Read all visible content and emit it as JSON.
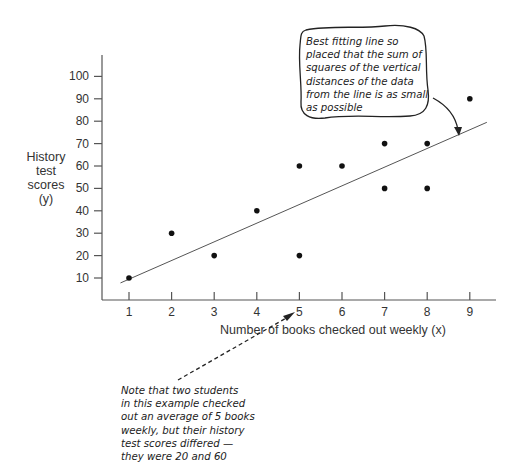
{
  "chart_data": {
    "type": "scatter",
    "title": "",
    "xlabel": "Number of books checked out weekly (x)",
    "ylabel": [
      "History",
      "test",
      "scores",
      "(y)"
    ],
    "x_ticks": [
      1,
      2,
      3,
      4,
      5,
      6,
      7,
      8,
      9
    ],
    "y_ticks": [
      10,
      20,
      30,
      40,
      50,
      60,
      70,
      80,
      90,
      100
    ],
    "xlim": [
      0.4,
      9.6
    ],
    "ylim": [
      0,
      105
    ],
    "grid": false,
    "points": [
      {
        "x": 1,
        "y": 10
      },
      {
        "x": 2,
        "y": 30
      },
      {
        "x": 3,
        "y": 20
      },
      {
        "x": 4,
        "y": 40
      },
      {
        "x": 5,
        "y": 20
      },
      {
        "x": 5,
        "y": 60
      },
      {
        "x": 6,
        "y": 60
      },
      {
        "x": 7,
        "y": 50
      },
      {
        "x": 7,
        "y": 70
      },
      {
        "x": 8,
        "y": 50
      },
      {
        "x": 8,
        "y": 70
      },
      {
        "x": 9,
        "y": 90
      }
    ],
    "regression_line": {
      "x_start": 0.8,
      "y_start": 7.8,
      "x_end": 9.4,
      "y_end": 79.5
    },
    "annotations": [
      {
        "id": "best-fit-note",
        "lines": [
          "Best fitting line so",
          "placed that the sum of",
          "squares of the vertical",
          "distances of the data",
          "from the line is as small",
          "as possible"
        ],
        "points_to": "regression line"
      },
      {
        "id": "x5-note",
        "lines": [
          "Note that two students",
          "in this example checked",
          "out an average of 5 books",
          "weekly, but their history",
          "test scores differed —",
          "they were 20 and 60"
        ],
        "points_to": "x = 5"
      }
    ]
  }
}
